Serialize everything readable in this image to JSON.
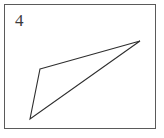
{
  "figure": {
    "label": "4",
    "background_color": "#ffffff",
    "frame": {
      "stroke_color": "#5a5a5a",
      "stroke_width": 1,
      "x": 4,
      "y": 4,
      "width": 152,
      "height": 125
    },
    "canvas": {
      "width": 164,
      "height": 138
    },
    "shapes": [
      {
        "name": "triangle",
        "type": "polygon",
        "stroke_color": "#2e2e2e",
        "stroke_width": 1.1,
        "fill": "none",
        "closed": true,
        "vertex_count": 3,
        "points": "40,69 140,41 30,119",
        "vertices": [
          {
            "label": "left-middle-vertex",
            "x": 40,
            "y": 69
          },
          {
            "label": "right-apex-vertex",
            "x": 140,
            "y": 41
          },
          {
            "label": "bottom-left-vertex",
            "x": 30,
            "y": 119
          }
        ]
      }
    ]
  }
}
